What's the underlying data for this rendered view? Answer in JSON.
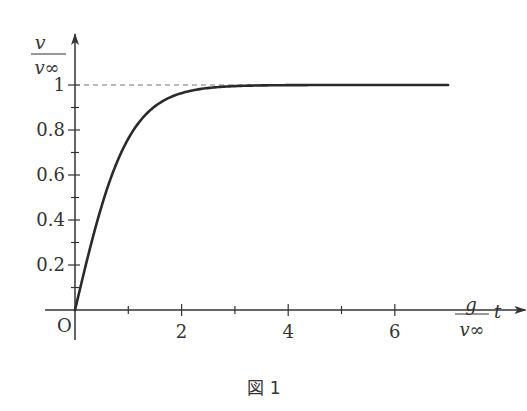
{
  "chart_data": {
    "type": "line",
    "title": "",
    "caption": "図 1",
    "function": "tanh",
    "series": [
      {
        "name": "v/v∞",
        "x": [
          0,
          0.25,
          0.5,
          0.75,
          1,
          1.25,
          1.5,
          1.75,
          2,
          2.5,
          3,
          3.5,
          4,
          5,
          6,
          7
        ],
        "values": [
          0,
          0.245,
          0.462,
          0.635,
          0.762,
          0.848,
          0.905,
          0.941,
          0.964,
          0.987,
          0.995,
          0.998,
          0.999,
          1.0,
          1.0,
          1.0
        ]
      }
    ],
    "asymptote": {
      "y": 1,
      "style": "dashed"
    },
    "xlabel": {
      "fraction_num": "g",
      "fraction_den": "v∞",
      "var": "t"
    },
    "ylabel": {
      "fraction_num": "v",
      "fraction_den": "v∞"
    },
    "origin_label": "O",
    "xlim": [
      0,
      7.4
    ],
    "ylim": [
      0,
      1.15
    ],
    "xticks_major": [
      2,
      4,
      6
    ],
    "xticks_major_labels": [
      "2",
      "4",
      "6"
    ],
    "xticks_minor": [
      1,
      3,
      5
    ],
    "yticks_major": [
      0.2,
      0.4,
      0.6,
      0.8,
      1
    ],
    "yticks_major_labels": [
      "0.2",
      "0.4",
      "0.6",
      "0.8",
      "1"
    ],
    "yticks_minor": [
      0.1,
      0.3,
      0.5,
      0.7,
      0.9
    ],
    "grid": false,
    "legend": "none"
  }
}
